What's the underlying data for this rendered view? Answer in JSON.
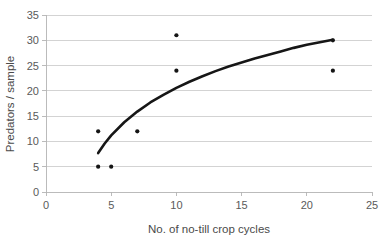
{
  "chart_data": {
    "type": "scatter",
    "title": "",
    "xlabel": "No. of no-till crop cycles",
    "ylabel": "Predators / sample",
    "xlim": [
      0,
      25
    ],
    "ylim": [
      0,
      35
    ],
    "xticks": [
      0,
      5,
      10,
      15,
      20,
      25
    ],
    "yticks": [
      0,
      5,
      10,
      15,
      20,
      25,
      30,
      35
    ],
    "xtick_labels": [
      "0",
      "5",
      "10",
      "15",
      "20",
      "25"
    ],
    "ytick_labels": [
      "0",
      "5",
      "10",
      "15",
      "20",
      "25",
      "30",
      "35"
    ],
    "grid": "horizontal",
    "legend": "none",
    "marker_color": "#151515",
    "curve_color": "#161616",
    "grid_color": "#c8c8c8",
    "points": [
      {
        "x": 4,
        "y": 5
      },
      {
        "x": 4,
        "y": 12
      },
      {
        "x": 5,
        "y": 5
      },
      {
        "x": 7,
        "y": 12
      },
      {
        "x": 10,
        "y": 24
      },
      {
        "x": 10,
        "y": 31
      },
      {
        "x": 22,
        "y": 24
      },
      {
        "x": 22,
        "y": 30
      }
    ],
    "series": [
      {
        "name": "observations",
        "type": "scatter",
        "x": [
          4,
          4,
          5,
          7,
          10,
          10,
          22,
          22
        ],
        "values": [
          5,
          12,
          5,
          12,
          24,
          31,
          24,
          30
        ]
      },
      {
        "name": "logarithmic trend",
        "type": "line",
        "x": [
          4.0,
          4.5,
          5.0,
          6.0,
          7.0,
          8.0,
          9.0,
          10.0,
          11.0,
          12.0,
          13.0,
          14.0,
          15.0,
          16.0,
          17.0,
          18.0,
          19.0,
          20.0,
          21.0,
          22.0
        ],
        "values": [
          7.7,
          9.6,
          11.2,
          13.8,
          15.9,
          17.7,
          19.2,
          20.6,
          21.8,
          22.9,
          23.9,
          24.8,
          25.6,
          26.4,
          27.1,
          27.8,
          28.5,
          29.1,
          29.6,
          30.1
        ]
      }
    ]
  }
}
